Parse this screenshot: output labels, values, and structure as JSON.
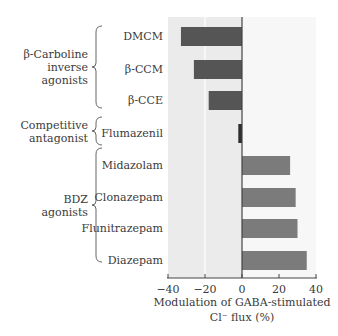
{
  "chart_data": {
    "type": "bar",
    "orientation": "horizontal",
    "title": "",
    "xlabel": "Modulation of GABA-stimulated Cl⁻ flux (%)",
    "xlabel_lines": [
      "Modulation of GABA-stimulated",
      "Cl⁻ flux (%)"
    ],
    "ylabel": "",
    "xlim": [
      -40,
      40
    ],
    "xticks": [
      -40,
      -20,
      0,
      20,
      40
    ],
    "xtick_labels": [
      "−40",
      "−20",
      "0",
      "20",
      "40"
    ],
    "grid": "vertical line at -20 only",
    "legend": null,
    "categories": [
      "DMCM",
      "β-CCM",
      "β-CCE",
      "Flumazenil",
      "Midazolam",
      "Clonazepam",
      "Flunitrazepam",
      "Diazepam"
    ],
    "values": [
      -33,
      -26,
      -18,
      -2,
      26,
      29,
      30,
      35
    ],
    "groups": [
      {
        "label_lines": [
          "β-Carboline",
          "inverse",
          "agonists"
        ],
        "members": [
          "DMCM",
          "β-CCM",
          "β-CCE"
        ]
      },
      {
        "label_lines": [
          "Competitive",
          "antagonist"
        ],
        "members": [
          "Flumazenil"
        ]
      },
      {
        "label_lines": [
          "BDZ",
          "agonists"
        ],
        "members": [
          "Midazolam",
          "Clonazepam",
          "Flunitrazepam",
          "Diazepam"
        ]
      }
    ],
    "colors": {
      "negative_bar": "#555555",
      "antagonist_bar": "#2e2e2e",
      "positive_bar": "#7b7b7b",
      "negative_bg": "#ebebeb",
      "positive_bg": "#f7f7f7",
      "axis": "#444444"
    }
  }
}
